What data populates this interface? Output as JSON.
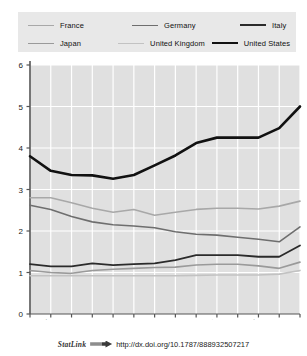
{
  "footer": {
    "statlink_label": "StatLink",
    "statlink_icon": "arrow-bar-icon",
    "url": "http://dx.doi.org/10.1787/888932507217"
  },
  "chart_data": {
    "type": "line",
    "title": "",
    "subtitle": "",
    "xlabel": "",
    "ylabel": "",
    "ylim": [
      0,
      6
    ],
    "yticks": [
      0,
      1,
      2,
      3,
      4,
      5,
      6
    ],
    "ytick_labels": [
      "0",
      "1",
      "2",
      "3",
      "4",
      "5",
      "6"
    ],
    "grid": true,
    "grid_color": "#ffffff",
    "plot_background": "#e0e0e0",
    "legend_position": "top",
    "legend_background": "#e8e8e8",
    "categories": [
      "1996",
      "1997",
      "1998",
      "1999",
      "2000",
      "2001",
      "2002",
      "2003",
      "2004",
      "2005",
      "2006",
      "2007",
      "2008",
      "2009"
    ],
    "x": [
      1996,
      1997,
      1998,
      1999,
      2000,
      2001,
      2002,
      2003,
      2004,
      2005,
      2006,
      2007,
      2008,
      2009
    ],
    "series": [
      {
        "name": "France",
        "color": "#a8a8a8",
        "width": 1.6,
        "values": [
          2.8,
          2.8,
          2.68,
          2.55,
          2.45,
          2.52,
          2.38,
          2.45,
          2.52,
          2.55,
          2.55,
          2.53,
          2.6,
          2.72
        ]
      },
      {
        "name": "Germany",
        "color": "#6e6e6e",
        "width": 1.6,
        "values": [
          2.62,
          2.52,
          2.35,
          2.22,
          2.15,
          2.12,
          2.08,
          1.98,
          1.92,
          1.9,
          1.85,
          1.8,
          1.74,
          2.1
        ]
      },
      {
        "name": "Italy",
        "color": "#2b2b2b",
        "width": 1.8,
        "values": [
          1.2,
          1.15,
          1.15,
          1.22,
          1.18,
          1.2,
          1.22,
          1.3,
          1.42,
          1.42,
          1.42,
          1.38,
          1.38,
          1.65
        ]
      },
      {
        "name": "Japan",
        "color": "#9a9a9a",
        "width": 1.6,
        "values": [
          1.05,
          1.0,
          0.98,
          1.05,
          1.08,
          1.1,
          1.12,
          1.13,
          1.18,
          1.2,
          1.2,
          1.16,
          1.1,
          1.25
        ]
      },
      {
        "name": "United Kingdom",
        "color": "#c2c2c2",
        "width": 1.6,
        "values": [
          0.92,
          0.92,
          0.92,
          0.92,
          0.92,
          0.92,
          0.92,
          0.92,
          0.93,
          0.94,
          0.94,
          0.94,
          0.96,
          1.05
        ]
      },
      {
        "name": "United States",
        "color": "#111111",
        "width": 2.6,
        "values": [
          3.8,
          3.45,
          3.35,
          3.34,
          3.26,
          3.35,
          3.58,
          3.82,
          4.12,
          4.25,
          4.25,
          4.25,
          4.48,
          5.0
        ]
      }
    ]
  },
  "legend": {
    "rows": [
      [
        {
          "label": "France",
          "color": "#a8a8a8",
          "width": 1.6
        },
        {
          "label": "Germany",
          "color": "#6e6e6e",
          "width": 1.6
        },
        {
          "label": "Italy",
          "color": "#2b2b2b",
          "width": 2.0
        }
      ],
      [
        {
          "label": "Japan",
          "color": "#9a9a9a",
          "width": 1.6
        },
        {
          "label": "United Kingdom",
          "color": "#c2c2c2",
          "width": 1.6
        },
        {
          "label": "United States",
          "color": "#111111",
          "width": 2.6
        }
      ]
    ]
  }
}
